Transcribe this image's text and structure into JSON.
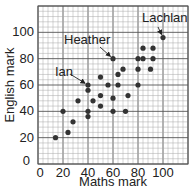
{
  "chart_data": {
    "type": "scatter",
    "title": "",
    "xlabel": "Maths mark",
    "ylabel": "English mark",
    "xlim": [
      0,
      120
    ],
    "ylim": [
      0,
      120
    ],
    "x_ticks": [
      0,
      20,
      40,
      60,
      80,
      100
    ],
    "y_ticks": [
      0,
      20,
      40,
      60,
      80,
      100
    ],
    "grid": true,
    "legend": null,
    "points": [
      {
        "x": 14,
        "y": 20
      },
      {
        "x": 20,
        "y": 40
      },
      {
        "x": 24,
        "y": 24
      },
      {
        "x": 28,
        "y": 32
      },
      {
        "x": 32,
        "y": 48
      },
      {
        "x": 40,
        "y": 60,
        "label": "Ian"
      },
      {
        "x": 40,
        "y": 56
      },
      {
        "x": 40,
        "y": 40
      },
      {
        "x": 40,
        "y": 36
      },
      {
        "x": 44,
        "y": 48
      },
      {
        "x": 50,
        "y": 66
      },
      {
        "x": 50,
        "y": 52
      },
      {
        "x": 50,
        "y": 44
      },
      {
        "x": 56,
        "y": 60
      },
      {
        "x": 60,
        "y": 80,
        "label": "Heather"
      },
      {
        "x": 60,
        "y": 50
      },
      {
        "x": 60,
        "y": 40
      },
      {
        "x": 64,
        "y": 68
      },
      {
        "x": 64,
        "y": 60
      },
      {
        "x": 68,
        "y": 72
      },
      {
        "x": 70,
        "y": 40
      },
      {
        "x": 72,
        "y": 52
      },
      {
        "x": 80,
        "y": 80
      },
      {
        "x": 80,
        "y": 72
      },
      {
        "x": 80,
        "y": 60
      },
      {
        "x": 84,
        "y": 88
      },
      {
        "x": 84,
        "y": 80
      },
      {
        "x": 90,
        "y": 72
      },
      {
        "x": 92,
        "y": 88
      },
      {
        "x": 92,
        "y": 80
      },
      {
        "x": 100,
        "y": 96,
        "label": "Lachlan"
      }
    ],
    "annotations": [
      {
        "text": "Lachlan",
        "target": {
          "x": 100,
          "y": 96
        },
        "label_px": [
          142,
          22
        ],
        "arrow_from_px": [
          158,
          27
        ]
      },
      {
        "text": "Heather",
        "target": {
          "x": 60,
          "y": 80
        },
        "label_px": [
          64,
          44
        ],
        "arrow_from_px": [
          100,
          47
        ]
      },
      {
        "text": "Ian",
        "target": {
          "x": 40,
          "y": 60
        },
        "label_px": [
          55,
          76
        ],
        "arrow_from_px": [
          70,
          74
        ]
      }
    ]
  },
  "colors": {
    "point": "#333333",
    "grid_minor": "#a8a8a8",
    "grid_major": "#555555",
    "text": "#222222"
  }
}
